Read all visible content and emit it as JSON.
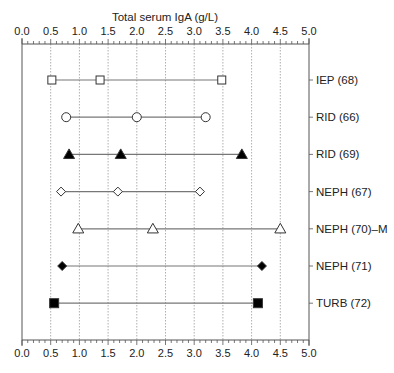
{
  "chart_data": {
    "type": "scatter",
    "subtype": "range-dot-plot",
    "title": "",
    "xlabel": "Total serum IgA (g/L)",
    "ylabel": "",
    "xlim": [
      0.0,
      5.0
    ],
    "x_ticks": [
      "0.0",
      "0.5",
      "1.0",
      "1.5",
      "2.0",
      "2.5",
      "3.0",
      "3.5",
      "4.0",
      "4.5",
      "5.0"
    ],
    "x_minor_tick_step": 0.1,
    "grid": {
      "vertical_dotted": true,
      "at": [
        0.5,
        1.0,
        1.5,
        2.0,
        2.5,
        3.0,
        3.5,
        4.0,
        4.5
      ]
    },
    "axis_positions": [
      "top",
      "bottom",
      "left",
      "right"
    ],
    "legend": "none (labels on right axis)",
    "series": [
      {
        "name": "IEP (68)",
        "marker": "square-open",
        "values": [
          0.52,
          1.36,
          3.48
        ]
      },
      {
        "name": "RID (66)",
        "marker": "circle-open",
        "values": [
          0.77,
          2.0,
          3.2
        ]
      },
      {
        "name": "RID (69)",
        "marker": "triangle-filled",
        "values": [
          0.82,
          1.72,
          3.83
        ]
      },
      {
        "name": "NEPH (67)",
        "marker": "diamond-open",
        "values": [
          0.68,
          1.67,
          3.1
        ]
      },
      {
        "name": "NEPH (70)–M",
        "marker": "triangle-open",
        "values": [
          0.98,
          2.28,
          4.5
        ]
      },
      {
        "name": "NEPH (71)",
        "marker": "diamond-filled",
        "values": [
          0.7,
          4.18
        ]
      },
      {
        "name": "TURB (72)",
        "marker": "square-filled",
        "values": [
          0.56,
          4.11
        ]
      }
    ]
  },
  "labels": {
    "axis_title": "Total serum IgA (g/L)",
    "rows": [
      "IEP (68)",
      "RID (66)",
      "RID (69)",
      "NEPH (67)",
      "NEPH (70)–M",
      "NEPH (71)",
      "TURB (72)"
    ]
  },
  "colors": {
    "axis": "#555555",
    "grid": "#9a9a9a",
    "line": "#777777",
    "marker_fill": "#000000",
    "marker_open_fill": "#ffffff",
    "marker_stroke": "#333333"
  }
}
